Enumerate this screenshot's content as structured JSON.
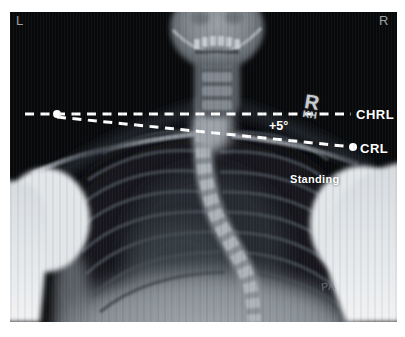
{
  "image": {
    "modality": "X-ray radiograph",
    "view": "PA standing chest and upper spine with clavicle reference lines"
  },
  "colors": {
    "page_background": "#ffffff",
    "film_background": "#08090b",
    "annotation_white": "#ffffff",
    "corner_label_gray": "#9ba1a4",
    "lead_marker_gray": "#c6cbcf",
    "pa_stamp_gray": "#71777c"
  },
  "corner_markers": {
    "left": "L",
    "right": "R"
  },
  "reference_lines": {
    "chrl_label": "CHRL",
    "crl_label": "CRL",
    "angle_label": "+5°"
  },
  "lead_marker": {
    "letter": "R",
    "initials": "KH"
  },
  "stamps": {
    "position": "Standing",
    "projection": "PA"
  }
}
